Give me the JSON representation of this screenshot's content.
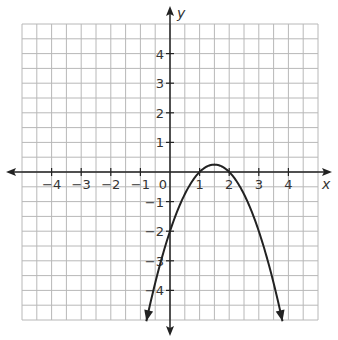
{
  "chart_data": {
    "type": "line",
    "title": "",
    "xlabel": "x",
    "ylabel": "y",
    "xlim": [
      -5,
      5
    ],
    "ylim": [
      -5,
      5
    ],
    "grid": true,
    "grid_step": 0.5,
    "x_ticks": [
      -4,
      -3,
      -2,
      -1,
      0,
      1,
      2,
      3,
      4
    ],
    "x_tick_labels": [
      "−4",
      "−3",
      "−2",
      "−1",
      "0",
      "1",
      "2",
      "3",
      "4"
    ],
    "y_ticks": [
      4,
      3,
      2,
      1,
      -1,
      -2,
      -3,
      -4
    ],
    "y_tick_labels": [
      "4",
      "3",
      "2",
      "1",
      "−1",
      "−2",
      "−3",
      "−4"
    ],
    "origin_label": "0",
    "series": [
      {
        "name": "parabola",
        "equation": "y = -(x-1)(x-2)",
        "x_range": [
          -0.8,
          3.8
        ],
        "arrows_at_ends": true,
        "key_points": {
          "x_intercepts": [
            1,
            2
          ],
          "y_intercept": -2,
          "vertex": [
            1.5,
            0.25
          ]
        },
        "x": [
          -0.8,
          -0.5,
          0,
          0.5,
          1,
          1.5,
          2,
          2.5,
          3,
          3.5,
          3.8
        ],
        "y": [
          -5.04,
          -3.75,
          -2,
          -0.75,
          0,
          0.25,
          0,
          -0.75,
          -2,
          -3.75,
          -5.04
        ]
      }
    ],
    "colors": {
      "grid": "#b8b8b8",
      "axes": "#222222",
      "curve": "#222222"
    }
  }
}
